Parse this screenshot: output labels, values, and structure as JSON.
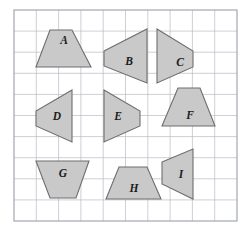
{
  "figure": {
    "background_color": "#ffffff",
    "grid": {
      "x": 14,
      "y": 10,
      "width": 223,
      "height": 211,
      "columns": 10,
      "rows": 10,
      "line_color": "#b9bcc4",
      "border_color": "#9aa0a8"
    },
    "style": {
      "shape_fill": "#c9c9c9",
      "shape_stroke": "#6e6e6e",
      "label_color": "#1b1b1b"
    },
    "shapes": [
      {
        "label": "A",
        "name": "shape-a",
        "kind": "trapezoid",
        "points": "50,30 72,30 91,67 36,67",
        "label_x": 64,
        "label_y": 41
      },
      {
        "label": "B",
        "name": "shape-b",
        "kind": "quadrilateral",
        "points": "104,51 147,29 147,83 104,66",
        "label_x": 129,
        "label_y": 62
      },
      {
        "label": "C",
        "name": "shape-c",
        "kind": "quadrilateral",
        "points": "157,29 193,51 193,67 157,83",
        "label_x": 180,
        "label_y": 63
      },
      {
        "label": "D",
        "name": "shape-d",
        "kind": "quadrilateral",
        "points": "72,90 72,142 36,126 36,111",
        "label_x": 57,
        "label_y": 117
      },
      {
        "label": "E",
        "name": "shape-e",
        "kind": "quadrilateral",
        "points": "104,90 140,111 140,126 104,142",
        "label_x": 118,
        "label_y": 117
      },
      {
        "label": "F",
        "name": "shape-f",
        "kind": "trapezoid",
        "points": "178,88 200,88 215,126 162,126",
        "label_x": 190,
        "label_y": 116
      },
      {
        "label": "G",
        "name": "shape-g",
        "kind": "trapezoid",
        "points": "36,161 89,161 76,198 50,198",
        "label_x": 63,
        "label_y": 174
      },
      {
        "label": "H",
        "name": "shape-h",
        "kind": "trapezoid",
        "points": "119,167 147,167 161,199 106,199",
        "label_x": 134,
        "label_y": 189
      },
      {
        "label": "I",
        "name": "shape-i",
        "kind": "quadrilateral",
        "points": "162,162 193,149 193,199 162,184",
        "label_x": 181,
        "label_y": 175
      }
    ]
  }
}
